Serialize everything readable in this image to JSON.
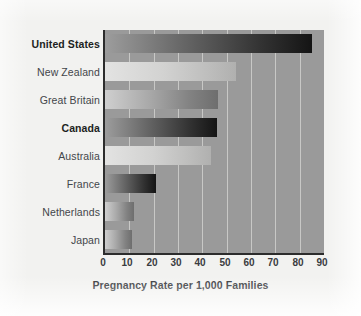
{
  "chart_data": {
    "type": "bar",
    "orientation": "horizontal",
    "title": "",
    "xlabel": "Pregnancy Rate per 1,000 Families",
    "ylabel": "",
    "xlim": [
      0,
      90
    ],
    "xticks": [
      "0",
      "10",
      "20",
      "30",
      "40",
      "50",
      "60",
      "70",
      "80",
      "90"
    ],
    "grid": "vertical",
    "legend": "none",
    "categories": [
      "United States",
      "New Zealand",
      "Great Britain",
      "Canada",
      "Australia",
      "France",
      "Netherlands",
      "Japan"
    ],
    "values": [
      85,
      54,
      46.5,
      46,
      43.5,
      21,
      12,
      11
    ],
    "emphasized_categories": [
      "United States",
      "Canada"
    ],
    "bar_styles": [
      "dark",
      "light",
      "mid",
      "dark",
      "light",
      "dark",
      "mid",
      "mid"
    ],
    "colors": {
      "plot_background": "#9a9a9a",
      "page_background": "#f2f2f0",
      "gridline": "#c8c8c6",
      "axis": "#2c2c2c",
      "label_text": "#43464a",
      "emphasis_text": "#1d1f22"
    }
  }
}
